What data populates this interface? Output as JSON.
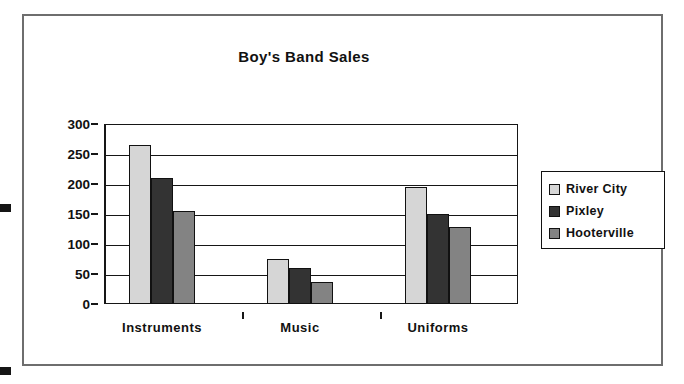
{
  "chart_data": {
    "type": "bar",
    "title": "Boy's Band Sales",
    "xlabel": "",
    "ylabel": "",
    "categories": [
      "Instruments",
      "Music",
      "Uniforms"
    ],
    "series": [
      {
        "name": "River City",
        "values": [
          265,
          75,
          195
        ],
        "color": "#d6d6d6"
      },
      {
        "name": "Pixley",
        "values": [
          210,
          60,
          150
        ],
        "color": "#333333"
      },
      {
        "name": "Hooterville",
        "values": [
          155,
          37,
          128
        ],
        "color": "#838383"
      }
    ],
    "ylim": [
      0,
      300
    ],
    "yticks": [
      0,
      50,
      100,
      150,
      200,
      250,
      300
    ],
    "ytick_labels": [
      "0",
      "50",
      "100",
      "150",
      "200",
      "250",
      "300"
    ],
    "grid": true,
    "legend_position": "right",
    "frame": true
  },
  "legend": {
    "items": [
      {
        "label": "River City",
        "color": "#d6d6d6"
      },
      {
        "label": "Pixley",
        "color": "#333333"
      },
      {
        "label": "Hooterville",
        "color": "#838383"
      }
    ]
  }
}
